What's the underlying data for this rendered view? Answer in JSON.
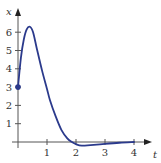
{
  "chart_data": {
    "type": "line",
    "title": "",
    "xlabel": "t",
    "ylabel": "x",
    "xlim": [
      0,
      4.4
    ],
    "ylim": [
      -0.3,
      6.8
    ],
    "grid": false,
    "legend": null,
    "x_ticks": [
      "1",
      "2",
      "3",
      "4"
    ],
    "y_ticks": [
      "1",
      "2",
      "3",
      "4",
      "5",
      "6"
    ],
    "series": [
      {
        "name": "x(t)",
        "color": "#2b3a8c",
        "x": [
          0,
          0.1,
          0.2,
          0.3,
          0.41,
          0.52,
          0.65,
          0.83,
          1.0,
          1.1,
          1.3,
          1.5,
          1.7,
          1.86,
          2.0,
          2.2,
          2.5,
          3.0,
          3.5,
          4.0
        ],
        "y": [
          3.0,
          4.6,
          5.6,
          6.15,
          6.3,
          6.0,
          5.1,
          3.9,
          2.9,
          2.3,
          1.4,
          0.65,
          0.2,
          0.0,
          -0.12,
          -0.2,
          -0.17,
          -0.1,
          -0.04,
          0.0
        ]
      }
    ],
    "annotations": [
      {
        "type": "point",
        "x": 0,
        "y": 3,
        "label": "initial value",
        "color": "#2b3a8c"
      }
    ]
  }
}
